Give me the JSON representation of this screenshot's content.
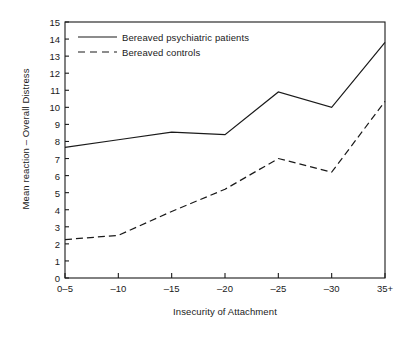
{
  "chart_data": {
    "type": "line",
    "title": "",
    "xlabel": "Insecurity of Attachment",
    "ylabel": "Mean reaction – Overall Distress",
    "categories": [
      "0–5",
      "–10",
      "–15",
      "–20",
      "–25",
      "–30",
      "35+"
    ],
    "ylim": [
      0,
      15
    ],
    "yticks": [
      0,
      1,
      2,
      3,
      4,
      5,
      6,
      7,
      8,
      9,
      10,
      11,
      12,
      13,
      14,
      15
    ],
    "ytick_labels": [
      "0",
      "1",
      "2",
      "3",
      "4",
      "5",
      "6",
      "7",
      "8",
      "9",
      "10",
      "11",
      "12",
      "13",
      "14",
      "15"
    ],
    "grid": false,
    "legend_position": "upper-left-inside",
    "series": [
      {
        "name": "Bereaved psychiatric patients",
        "style": "solid",
        "color": "#1a1a1a",
        "values": [
          7.65,
          8.1,
          8.55,
          8.4,
          10.9,
          10.0,
          13.8
        ]
      },
      {
        "name": "Bereaved controls",
        "style": "dashed",
        "color": "#1a1a1a",
        "values": [
          2.25,
          2.5,
          3.9,
          5.2,
          7.0,
          6.2,
          10.35
        ]
      }
    ]
  },
  "legend": {
    "items": [
      {
        "label": "Bereaved psychiatric patients",
        "style": "solid"
      },
      {
        "label": "Bereaved controls",
        "style": "dashed"
      }
    ]
  },
  "colors": {
    "axis": "#1a1a1a",
    "line": "#1a1a1a",
    "background": "#ffffff"
  }
}
